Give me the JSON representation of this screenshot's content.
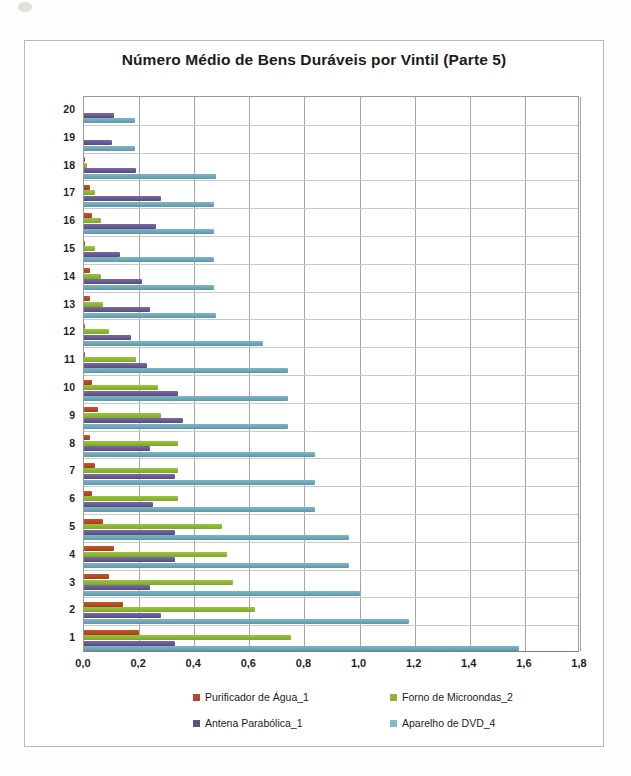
{
  "chart_data": {
    "type": "bar",
    "orientation": "horizontal",
    "title": "Número Médio de Bens Duráveis por Vintil (Parte 5)",
    "xlabel": "",
    "ylabel": "",
    "xlim": [
      0.0,
      1.8
    ],
    "xticks": [
      "0,0",
      "0,2",
      "0,4",
      "0,6",
      "0,8",
      "1,0",
      "1,2",
      "1,4",
      "1,6",
      "1,8"
    ],
    "xtick_values": [
      0.0,
      0.2,
      0.4,
      0.6,
      0.8,
      1.0,
      1.2,
      1.4,
      1.6,
      1.8
    ],
    "grid": true,
    "legend_position": "bottom",
    "categories": [
      "1",
      "2",
      "3",
      "4",
      "5",
      "6",
      "7",
      "8",
      "9",
      "10",
      "11",
      "12",
      "13",
      "14",
      "15",
      "16",
      "17",
      "18",
      "19",
      "20"
    ],
    "series": [
      {
        "name": "Purificador de Água_1",
        "color": "#b5462a",
        "values": [
          0.2,
          0.14,
          0.09,
          0.11,
          0.07,
          0.03,
          0.04,
          0.02,
          0.05,
          0.03,
          0.005,
          0.004,
          0.02,
          0.02,
          0.005,
          0.03,
          0.02,
          0.004,
          0.0,
          0.0
        ]
      },
      {
        "name": "Forno de Microondas_2",
        "color": "#9bae3d",
        "values": [
          0.75,
          0.62,
          0.54,
          0.52,
          0.5,
          0.34,
          0.34,
          0.34,
          0.28,
          0.27,
          0.19,
          0.09,
          0.07,
          0.06,
          0.04,
          0.06,
          0.04,
          0.01,
          0.0,
          0.0
        ]
      },
      {
        "name": "Antena Parabólica_1",
        "color": "#5d5280",
        "values": [
          0.33,
          0.28,
          0.24,
          0.33,
          0.33,
          0.25,
          0.33,
          0.24,
          0.36,
          0.34,
          0.23,
          0.17,
          0.24,
          0.21,
          0.13,
          0.26,
          0.28,
          0.19,
          0.1,
          0.11
        ]
      },
      {
        "name": "Aparelho de DVD_4",
        "color": "#86b9c6",
        "values": [
          1.58,
          1.18,
          1.0,
          0.96,
          0.96,
          0.84,
          0.84,
          0.84,
          0.74,
          0.74,
          0.74,
          0.65,
          0.48,
          0.47,
          0.47,
          0.47,
          0.47,
          0.48,
          0.185,
          0.185
        ]
      }
    ]
  },
  "legend": {
    "items": [
      {
        "label": "Purificador de Água_1"
      },
      {
        "label": "Forno de Microondas_2"
      },
      {
        "label": "Antena Parabólica_1"
      },
      {
        "label": "Aparelho de DVD_4"
      }
    ]
  }
}
